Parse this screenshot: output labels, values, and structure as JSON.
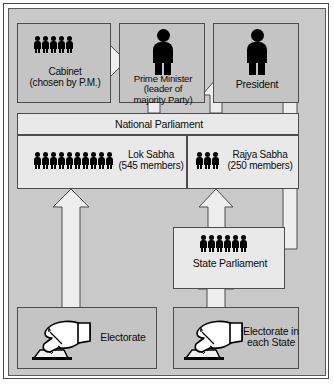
{
  "diagram": {
    "type": "flowchart",
    "background_color": "#c9c9c9",
    "box_color": "#c4c4c4",
    "arrow_color": "#e8e8e8",
    "nodes": [
      {
        "id": "cabinet",
        "label_lines": [
          "Cabinet",
          "(chosen by P.M.)"
        ],
        "icon": "five-people-icon",
        "people_count": 5
      },
      {
        "id": "prime-minister",
        "label_lines": [
          "Prime Minister",
          "(leader of",
          "majority Party)"
        ],
        "icon": "single-person-icon",
        "people_count": 1
      },
      {
        "id": "president",
        "label_lines": [
          "President"
        ],
        "icon": "single-person-icon",
        "people_count": 1
      },
      {
        "id": "national-parliament",
        "label_lines": [
          "National Parliament"
        ],
        "icon": "none",
        "people_count": 0
      },
      {
        "id": "lok-sabha",
        "label_lines": [
          "Lok Sabha",
          "(545 members)"
        ],
        "icon": "ten-people-icon",
        "people_count": 10,
        "members": 545
      },
      {
        "id": "rajya-sabha",
        "label_lines": [
          "Rajya Sabha",
          "(250 members)"
        ],
        "icon": "three-people-icon",
        "people_count": 3,
        "members": 250
      },
      {
        "id": "state-parliament",
        "label_lines": [
          "State Parliament"
        ],
        "icon": "six-people-icon",
        "people_count": 6
      },
      {
        "id": "electorate",
        "label_lines": [
          "Electorate"
        ],
        "icon": "hand-marking-ballot-icon"
      },
      {
        "id": "electorate-each-state",
        "label_lines": [
          "Electorate in",
          "each State"
        ],
        "icon": "hand-marking-ballot-icon"
      }
    ],
    "edges": [
      {
        "from": "prime-minister",
        "to": "cabinet",
        "direction": "left"
      },
      {
        "from": "president",
        "to": "prime-minister",
        "direction": "left"
      },
      {
        "from": "national-parliament",
        "to": "prime-minister",
        "direction": "up"
      },
      {
        "from": "national-parliament",
        "to": "president",
        "direction": "up"
      },
      {
        "from": "state-parliament",
        "to": "president",
        "direction": "left"
      },
      {
        "from": "electorate",
        "to": "lok-sabha",
        "direction": "up"
      },
      {
        "from": "electorate-each-state",
        "to": "state-parliament",
        "direction": "up"
      },
      {
        "from": "state-parliament",
        "to": "rajya-sabha",
        "direction": "up"
      }
    ]
  },
  "labels": {
    "cabinet_l1": "Cabinet",
    "cabinet_l2": "(chosen by P.M.)",
    "pm_l1": "Prime Minister",
    "pm_l2": "(leader of",
    "pm_l3": "majority Party)",
    "president_l1": "President",
    "national_parliament": "National Parliament",
    "lok_l1": "Lok Sabha",
    "lok_l2": "(545 members)",
    "rajya_l1": "Rajya Sabha",
    "rajya_l2": "(250 members)",
    "state_parliament": "State Parliament",
    "electorate": "Electorate",
    "electorate_state_l1": "Electorate in",
    "electorate_state_l2": "each State"
  }
}
